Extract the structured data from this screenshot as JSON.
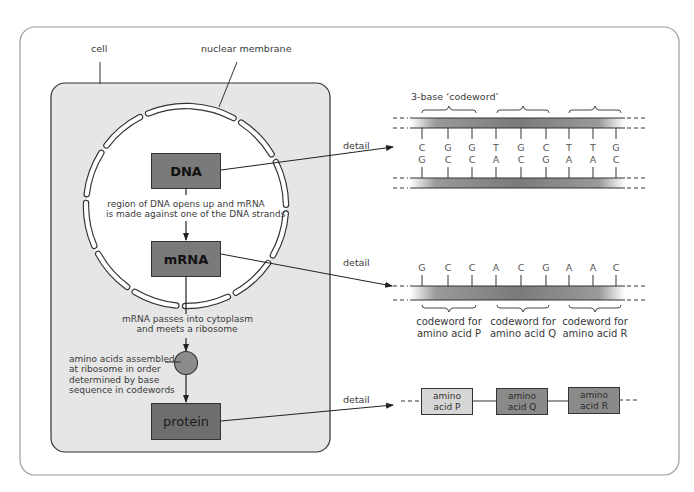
{
  "diagram": {
    "colors": {
      "cell_fill": "#e6e6e6",
      "box_dark": "#7a7a7a",
      "box_protein": "#6e6e6e",
      "ribosome": "#8c8c8c",
      "amino_light": "#d6d6d6",
      "amino_mid": "#8a8a8a",
      "outline": "#333333"
    },
    "labels": {
      "cell": "cell",
      "nuclear_membrane": "nuclear membrane",
      "dna": "DNA",
      "mrna": "mRNA",
      "protein": "protein",
      "step1_line1": "region of DNA opens up and mRNA",
      "step1_line2": "is made against one of the DNA strands",
      "step2_line1": "mRNA passes into cytoplasm",
      "step2_line2": "and meets a ribosome",
      "step3_line1": "amino acids assembled",
      "step3_line2": "at ribosome in order",
      "step3_line3": "determined by base",
      "step3_line4": "sequence in codewords",
      "detail": "detail"
    },
    "dna_detail": {
      "codeword_label": "3-base ‘codeword’",
      "top_strand": [
        "C",
        "G",
        "G",
        "T",
        "G",
        "C",
        "T",
        "T",
        "G"
      ],
      "bottom_strand": [
        "G",
        "C",
        "C",
        "A",
        "C",
        "G",
        "A",
        "A",
        "C"
      ]
    },
    "mrna_detail": {
      "bases": [
        "G",
        "C",
        "C",
        "A",
        "C",
        "G",
        "A",
        "A",
        "C"
      ],
      "codewords": [
        {
          "line1": "codeword for",
          "line2": "amino acid P"
        },
        {
          "line1": "codeword for",
          "line2": "amino acid Q"
        },
        {
          "line1": "codeword for",
          "line2": "amino acid R"
        }
      ]
    },
    "protein_detail": {
      "amino_acids": [
        {
          "line1": "amino",
          "line2": "acid P"
        },
        {
          "line1": "amino",
          "line2": "acid Q"
        },
        {
          "line1": "amino",
          "line2": "acid R"
        }
      ]
    }
  }
}
